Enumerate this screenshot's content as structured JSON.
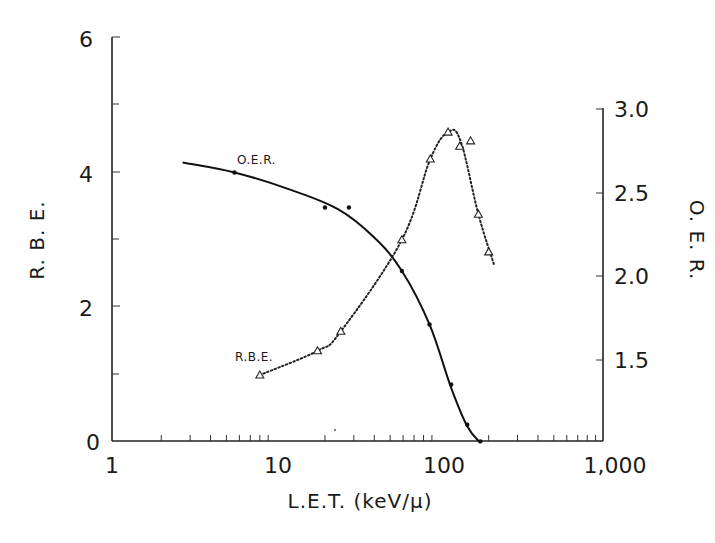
{
  "chart_data": {
    "type": "line",
    "title": "",
    "xlabel": "L.E.T. (keV/μ)",
    "ylabel": "R.B.E.",
    "ylabel_right": "O.E.R.",
    "xscale": "log",
    "xlim": [
      1,
      1000
    ],
    "ylim": [
      0,
      6
    ],
    "ylim_right": [
      1.0,
      3.0
    ],
    "x_ticks": [
      "1",
      "10",
      "100",
      "1,000"
    ],
    "y_ticks": [
      "0",
      "2",
      "4",
      "6"
    ],
    "y_ticks_right": [
      "1.5",
      "2.0",
      "2.5",
      "3.0"
    ],
    "grid": false,
    "legend": "inline annotations",
    "annotations": [
      {
        "text": "O.E.R.",
        "near": "solid curve, upper left"
      },
      {
        "text": "R.B.E.",
        "near": "dotted curve, lower left"
      }
    ],
    "series": [
      {
        "name": "R.B.E.",
        "axis": "left",
        "line_style": "dotted",
        "marker": "open triangle",
        "x": [
          8,
          18,
          25,
          59,
          88,
          113,
          133,
          155,
          173,
          200
        ],
        "y": [
          0.98,
          1.34,
          1.63,
          2.99,
          4.19,
          4.59,
          4.38,
          4.46,
          3.37,
          2.81
        ]
      },
      {
        "name": "O.E.R.",
        "axis": "right",
        "line_style": "solid",
        "marker": "filled dot",
        "x": [
          5.6,
          20,
          28,
          59,
          87,
          118,
          148,
          178
        ],
        "y": [
          2.62,
          2.41,
          2.41,
          2.03,
          1.71,
          1.35,
          1.11,
          1.01
        ]
      }
    ]
  },
  "labels": {
    "ylabel_left": "R. B. E.",
    "ylabel_right": "O. E. R.",
    "xlabel": "L.E.T. (keV/μ)",
    "oer_annotation": "O.E.R.",
    "rbe_annotation": "R.B.E.",
    "x_tick_1": "1",
    "x_tick_10": "10",
    "x_tick_100": "100",
    "x_tick_1000": "1,000",
    "y_tick_0": "0",
    "y_tick_2": "2",
    "y_tick_4": "4",
    "y_tick_6": "6",
    "yr_tick_15": "1.5",
    "yr_tick_20": "2.0",
    "yr_tick_25": "2.5",
    "yr_tick_30": "3.0"
  }
}
